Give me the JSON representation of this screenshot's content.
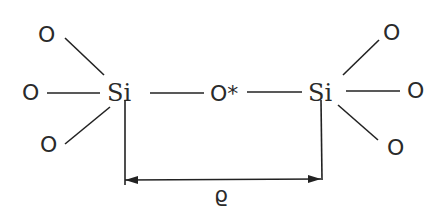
{
  "diagram": {
    "left_silicon": {
      "label": "Si",
      "neighbors": [
        "O",
        "O",
        "O"
      ]
    },
    "bridge_oxygen": {
      "label": "O*"
    },
    "right_silicon": {
      "label": "Si",
      "neighbors": [
        "O",
        "O",
        "O"
      ]
    },
    "distance_label": "ϱ",
    "colors": {
      "ink": "#222222",
      "background": "#ffffff"
    }
  }
}
